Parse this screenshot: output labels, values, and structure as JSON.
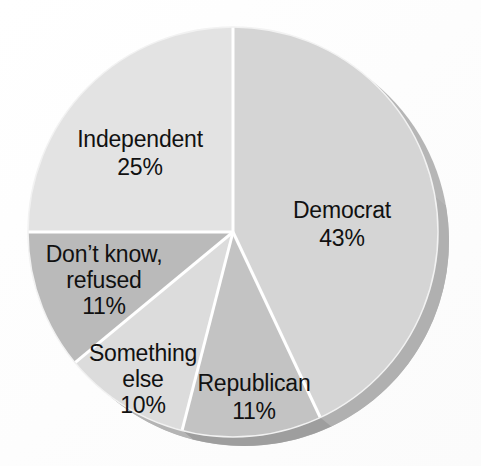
{
  "chart_data": {
    "type": "pie",
    "title": "",
    "subtitle": "",
    "xlabel": "",
    "ylabel": "",
    "legend_position": "none",
    "grid": false,
    "units": "percent",
    "total": 100,
    "start_angle_deg": 0,
    "direction": "clockwise",
    "style": "3d-extruded-grayscale",
    "categories": [
      "Democrat",
      "Republican",
      "Something else",
      "Don't know, refused",
      "Independent"
    ],
    "values": [
      43,
      11,
      10,
      11,
      25
    ],
    "slices": [
      {
        "name": "Democrat",
        "label": "Democrat",
        "value": 43,
        "value_text": "43%",
        "color": "#d5d5d5",
        "side_color": "#b0b0b0",
        "start_deg": 0,
        "end_deg": 154.8,
        "label_x": 342,
        "label_y": 212,
        "pct_x": 342,
        "pct_y": 240
      },
      {
        "name": "Republican",
        "label": "Republican",
        "value": 11,
        "value_text": "11%",
        "color": "#c3c3c3",
        "side_color": "#9e9e9e",
        "start_deg": 154.8,
        "end_deg": 194.4,
        "label_x": 254,
        "label_y": 385,
        "pct_x": 254,
        "pct_y": 413
      },
      {
        "name": "Something else",
        "label": "Something",
        "label_line2": "else",
        "value": 10,
        "value_text": "10%",
        "color": "#dcdcdc",
        "side_color": "#b4b4b4",
        "start_deg": 194.4,
        "end_deg": 230.4,
        "label_x": 143,
        "label_y": 355,
        "label2_x": 143,
        "label2_y": 381,
        "pct_x": 143,
        "pct_y": 407
      },
      {
        "name": "Don't know, refused",
        "label": "Don’t know,",
        "label_line2": "refused",
        "value": 11,
        "value_text": "11%",
        "color": "#bababa",
        "side_color": "#979797",
        "start_deg": 230.4,
        "end_deg": 270.0,
        "label_x": 104,
        "label_y": 256,
        "label2_x": 104,
        "label2_y": 282,
        "pct_x": 104,
        "pct_y": 308
      },
      {
        "name": "Independent",
        "label": "Independent",
        "value": 25,
        "value_text": "25%",
        "color": "#e3e3e3",
        "side_color": "#bdbdbd",
        "start_deg": 270.0,
        "end_deg": 360.0,
        "label_x": 140,
        "label_y": 141,
        "pct_x": 140,
        "pct_y": 169
      }
    ],
    "geometry": {
      "center_x": 233,
      "center_y": 232,
      "radius": 205,
      "depth_offset_x": 11,
      "depth_offset_y": 9,
      "separator_color": "#ffffff",
      "separator_width": 3
    }
  },
  "artifact": {
    "text": "",
    "x": 383,
    "y": 74
  }
}
